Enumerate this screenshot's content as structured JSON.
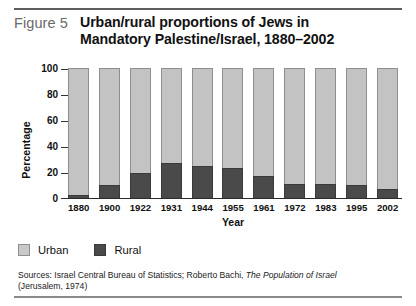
{
  "figure": {
    "label": "Figure 5",
    "title_line1": "Urban/rural proportions of Jews in",
    "title_line2": "Mandatory Palestine/Israel, 1880–2002"
  },
  "legend": {
    "position": "bottom-left",
    "items": [
      {
        "label": "Urban",
        "color": "#c9c9c9",
        "swatch": "urban"
      },
      {
        "label": "Rural",
        "color": "#4a4a4a",
        "swatch": "rural"
      }
    ]
  },
  "sources": {
    "line1_pre": "Sources: Israel Central Bureau of Statistics; Roberto Bachi, ",
    "line1_italic": "The Population of Israel",
    "line2": "(Jerusalem, 1974)"
  },
  "chart_data": {
    "type": "bar",
    "stacked": true,
    "stacked_mode": "percent",
    "title": "Urban/rural proportions of Jews in Mandatory Palestine/Israel, 1880–2002",
    "xlabel": "Year",
    "ylabel": "Percentage",
    "ylim": [
      0,
      100
    ],
    "yticks": [
      100,
      80,
      60,
      40,
      20,
      0
    ],
    "ytick_labels": [
      "100",
      "80",
      "60",
      "40",
      "20",
      "0"
    ],
    "grid": false,
    "legend_position": "bottom-left",
    "categories": [
      "1880",
      "1900",
      "1922",
      "1931",
      "1944",
      "1955",
      "1961",
      "1972",
      "1983",
      "1995",
      "2002"
    ],
    "series": [
      {
        "name": "Urban",
        "color": "#c3c3c3",
        "values": [
          98,
          90,
          81,
          73,
          75,
          77,
          83,
          89,
          89,
          90,
          93
        ]
      },
      {
        "name": "Rural",
        "color": "#4a4a4a",
        "values": [
          2,
          10,
          19,
          27,
          25,
          23,
          17,
          11,
          11,
          10,
          7
        ]
      }
    ]
  }
}
